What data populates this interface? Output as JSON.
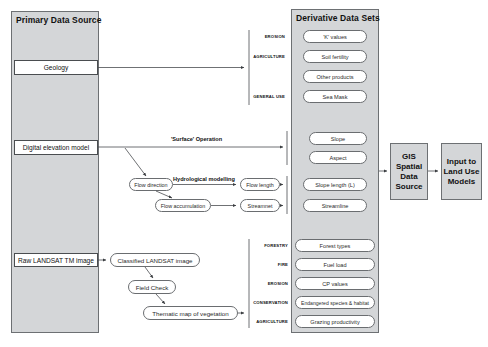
{
  "diagram": {
    "columns": {
      "primary": {
        "title": "Primary Data Source"
      },
      "derivative": {
        "title": "Derivative Data Sets"
      }
    },
    "primary_sources": [
      {
        "id": "geology",
        "label": "Geology"
      },
      {
        "id": "dem",
        "label": "Digital elevation model"
      },
      {
        "id": "landsat",
        "label": "Raw LANDSAT TM image"
      }
    ],
    "operations": [
      {
        "id": "surface-operation",
        "label": "'Surface' Operation"
      },
      {
        "id": "hydrological-modelling",
        "label": "Hydrological modelling"
      }
    ],
    "process_nodes": [
      {
        "id": "flow-direction",
        "label": "Flow direction"
      },
      {
        "id": "flow-accumulation",
        "label": "Flow accumulation"
      },
      {
        "id": "flow-length",
        "label": "Flow length"
      },
      {
        "id": "streamnet",
        "label": "Streamnet"
      },
      {
        "id": "classified-landsat",
        "label": "Classified LANDSAT image"
      },
      {
        "id": "field-check",
        "label": "Field Check"
      },
      {
        "id": "thematic-map",
        "label": "Thematic map of vegetation"
      }
    ],
    "groups": [
      {
        "id": "geology-group",
        "categories": [
          "EROSION",
          "AGRICULTURE",
          "GENERAL USE"
        ],
        "datasets": [
          "'K' values",
          "Soil fertility",
          "Other products",
          "Sea Mask"
        ]
      },
      {
        "id": "surface-group",
        "categories": [],
        "datasets": [
          "Slope",
          "Aspect"
        ]
      },
      {
        "id": "hydrology-group",
        "categories": [],
        "datasets": [
          "Slope length (L)",
          "Streamline"
        ]
      },
      {
        "id": "vegetation-group",
        "categories": [
          "FORESTRY",
          "FIRE",
          "EROSION",
          "CONSERVATION",
          "AGRICULTURE"
        ],
        "datasets": [
          "Forest types",
          "Fuel load",
          "CP values",
          "Endangered species & habitat",
          "Grazing productivity"
        ]
      }
    ],
    "outputs": [
      {
        "id": "gis-spatial-data-source",
        "label": "GIS\nSpatial\nData\nSource"
      },
      {
        "id": "input-to-land-use-models",
        "label": "Input to\nLand Use\nModels"
      }
    ],
    "colors": {
      "panel_fill": "#d4d6d8",
      "panel_stroke": "#6d7073",
      "node_fill": "#ffffff",
      "node_stroke": "#6a6d70",
      "wire": "#4a4d50",
      "text": "#111111"
    }
  }
}
